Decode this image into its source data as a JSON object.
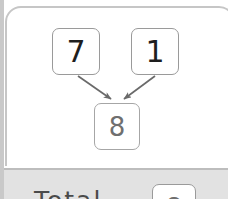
{
  "diagram": {
    "nodes": [
      {
        "id": "operand-a",
        "label": "7"
      },
      {
        "id": "operand-b",
        "label": "1"
      },
      {
        "id": "result",
        "label": "8"
      }
    ],
    "edges": [
      {
        "from": "operand-a",
        "to": "result",
        "arrow": "arrowhead"
      },
      {
        "from": "operand-b",
        "to": "result",
        "arrow": "arrowhead"
      }
    ]
  },
  "footer": {
    "text": "Total",
    "box_label": "8"
  },
  "colors": {
    "card_background": "#ffffff",
    "card_border": "#c6c6c6",
    "node_border": "#9a9a9a",
    "node_text": "#1e1e1e",
    "result_text": "#6f6f6f",
    "arrow": "#6a6a6a",
    "footer_background": "#e2e2e2",
    "footer_border": "#bdbdbd",
    "edge_strip": "#c9c9c9"
  }
}
